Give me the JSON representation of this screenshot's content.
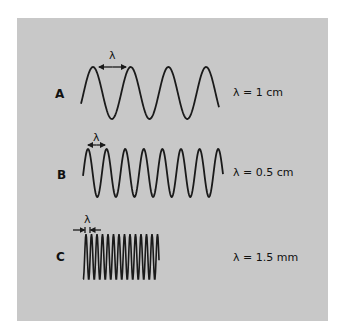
{
  "figure": {
    "background_color": "#c8c8c8",
    "wave_color": "#1a1a1a",
    "rows": [
      {
        "label": "A",
        "value_text": "λ = 1 cm",
        "lambda_mark": "λ",
        "wave": {
          "x_start": 81,
          "x_end": 219,
          "mid_y": 93,
          "amplitude": 26,
          "period": 37.7,
          "first_peak_x": 93
        },
        "arrow": {
          "style": "double",
          "x1": 99,
          "x2": 126,
          "y": 67
        },
        "label_pos": {
          "x": 55,
          "y": 87
        },
        "value_pos": {
          "x": 233,
          "y": 86
        },
        "mark_pos": {
          "x": 109,
          "y": 49
        }
      },
      {
        "label": "B",
        "value_text": "λ = 0.5 cm",
        "lambda_mark": "λ",
        "wave": {
          "x_start": 83,
          "x_end": 223,
          "mid_y": 173,
          "amplitude": 24,
          "period": 18.6,
          "first_peak_x": 88
        },
        "arrow": {
          "style": "double",
          "x1": 88,
          "x2": 105,
          "y": 145
        },
        "label_pos": {
          "x": 57,
          "y": 168
        },
        "value_pos": {
          "x": 233,
          "y": 166
        },
        "mark_pos": {
          "x": 93,
          "y": 131
        }
      },
      {
        "label": "C",
        "value_text": "λ = 1.5 mm",
        "lambda_mark": "λ",
        "wave": {
          "x_start": 83,
          "x_end": 159,
          "mid_y": 257,
          "amplitude": 23,
          "period": 5.5,
          "first_peak_x": 86
        },
        "arrow": {
          "style": "inward",
          "x1": 85,
          "x2": 90,
          "y": 230,
          "outer_left": 73,
          "outer_right": 101
        },
        "label_pos": {
          "x": 56,
          "y": 250
        },
        "value_pos": {
          "x": 233,
          "y": 251
        },
        "mark_pos": {
          "x": 84,
          "y": 213
        }
      }
    ]
  }
}
